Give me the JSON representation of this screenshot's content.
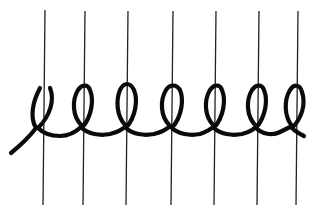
{
  "diagram": {
    "description": "Coil/loop stitch wrapping around vertical warp threads",
    "background_color": "#ffffff",
    "warp_color": "#222222",
    "thread_color": "#0a0a0a",
    "warp_count": 7,
    "loop_count": 7,
    "warp_lines": [
      {
        "x_top": 45,
        "y_top": 10,
        "x_bottom": 43,
        "y_bottom": 205
      },
      {
        "x_top": 85,
        "y_top": 11,
        "x_bottom": 83,
        "y_bottom": 205
      },
      {
        "x_top": 128,
        "y_top": 11,
        "x_bottom": 126,
        "y_bottom": 205
      },
      {
        "x_top": 173,
        "y_top": 11,
        "x_bottom": 171,
        "y_bottom": 205
      },
      {
        "x_top": 216,
        "y_top": 11,
        "x_bottom": 214,
        "y_bottom": 205
      },
      {
        "x_top": 259,
        "y_top": 11,
        "x_bottom": 257,
        "y_bottom": 205
      },
      {
        "x_top": 298,
        "y_top": 11,
        "x_bottom": 296,
        "y_bottom": 205
      }
    ],
    "thread_path": "M11,153 C22,144 30,136 36,128 C30,118 32,103 40,88 M50,88 C55,100 50,116 38,128 C44,134 50,136 60,136 C68,136 76,132 82,126 C72,116 72,100 78,90 C82,84 88,84 90,90 C94,100 92,116 82,128 C88,134 100,136 110,134 C118,132 122,130 126,126 C116,116 116,100 120,90 C124,82 130,82 134,90 C138,100 136,116 126,128 C132,134 144,136 154,134 C162,132 166,130 170,126 C160,116 160,100 166,90 C170,84 176,84 180,90 C184,100 182,116 172,128 C178,134 190,136 200,134 C206,132 210,130 214,126 C204,116 204,100 210,90 C214,84 220,84 222,90 C226,100 224,116 214,128 C220,134 232,136 242,134 C250,132 254,130 256,126 C246,116 246,100 252,90 C256,84 262,84 264,90 C268,100 266,116 256,128 C262,134 272,136 280,132 C284,130 288,128 292,126 C284,116 284,100 290,90 C294,84 300,84 302,92 C306,104 302,118 292,128 C296,132 300,134 304,136"
  }
}
